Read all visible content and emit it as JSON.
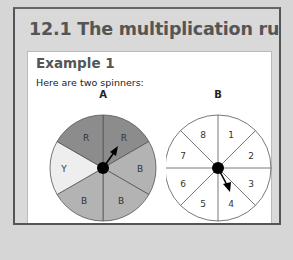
{
  "section": {
    "title": "12.1 The multiplication rule"
  },
  "example": {
    "heading": "Example 1",
    "intro": "Here are two spinners:",
    "question": "Work out the probability that spinner A lands"
  },
  "spinner_a": {
    "label": "A",
    "sectors": [
      {
        "label": "R",
        "color": "#8c8c8c"
      },
      {
        "label": "B",
        "color": "#b3b3b3"
      },
      {
        "label": "B",
        "color": "#b3b3b3"
      },
      {
        "label": "B",
        "color": "#b3b3b3"
      },
      {
        "label": "Y",
        "color": "#eeeeee"
      },
      {
        "label": "R",
        "color": "#8c8c8c"
      }
    ]
  },
  "spinner_b": {
    "label": "B",
    "sectors": [
      "1",
      "2",
      "3",
      "4",
      "5",
      "6",
      "7",
      "8"
    ]
  },
  "colors": {
    "frame": "#555555",
    "panel": "#d9d9d9",
    "title": "#555555"
  }
}
